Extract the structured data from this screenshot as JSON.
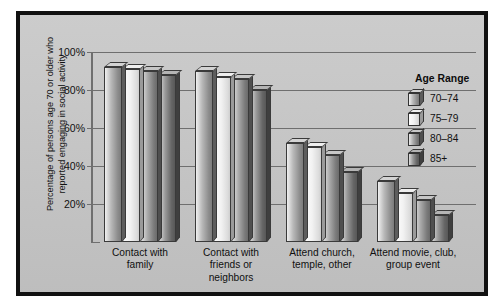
{
  "chart_data": {
    "type": "bar",
    "title": "",
    "xlabel": "",
    "ylabel": "Percentage of persons age 70 or older who reported engaging in social activity",
    "ylim": [
      0,
      100
    ],
    "yticks": [
      "20%",
      "40%",
      "60%",
      "80%",
      "100%"
    ],
    "ytick_values": [
      20,
      40,
      60,
      80,
      100
    ],
    "grid": true,
    "legend_position": "right",
    "legend_title": "Age Range",
    "categories": [
      "Contact with family",
      "Contact with friends or neighbors",
      "Attend church, temple, other",
      "Attend movie, club, group event"
    ],
    "category_lines": [
      [
        "Contact with",
        "family"
      ],
      [
        "Contact with",
        "friends or",
        "neighbors"
      ],
      [
        "Attend church,",
        "temple, other"
      ],
      [
        "Attend movie, club,",
        "group event"
      ]
    ],
    "series": [
      {
        "name": "70–74",
        "values": [
          92,
          90,
          52,
          32
        ],
        "color": "#9e9e9e"
      },
      {
        "name": "75–79",
        "values": [
          91,
          87,
          50,
          26
        ],
        "color": "#efefef"
      },
      {
        "name": "80–84",
        "values": [
          90,
          86,
          46,
          22
        ],
        "color": "#8d8d8d"
      },
      {
        "name": "85+",
        "values": [
          88,
          80,
          37,
          14
        ],
        "color": "#6f6f6f"
      }
    ]
  },
  "figure": {
    "frame_color": "#111111",
    "plot_background": "#c6c6c6",
    "gridline_color": "#6f6f6f",
    "page_background": "#ffffff"
  }
}
